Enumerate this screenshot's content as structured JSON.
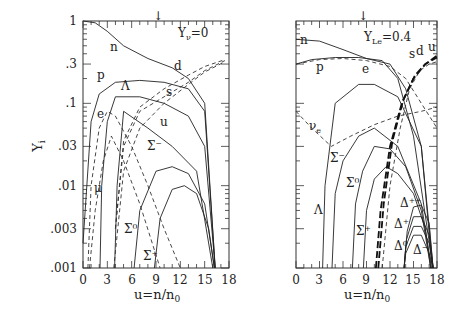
{
  "chart_data": [
    {
      "type": "line",
      "panel": "left",
      "title": "",
      "annotation": "Yν=0",
      "xlabel": "u=n/n0",
      "ylabel": "Yi",
      "xlim": [
        0,
        18
      ],
      "ylim": [
        0.001,
        1
      ],
      "yscale": "log",
      "xticks": [
        "0",
        "3",
        "6",
        "9",
        "12",
        "15",
        "18"
      ],
      "yticks": [
        "1",
        ".3",
        ".1",
        ".03",
        ".01",
        ".003",
        ".001"
      ],
      "series": [
        {
          "name": "n",
          "style": "solid",
          "x": [
            0,
            1.5,
            3,
            5,
            8,
            11,
            13,
            15,
            16.3
          ],
          "y": [
            1,
            0.95,
            0.75,
            0.5,
            0.35,
            0.27,
            0.2,
            0.1,
            0.001
          ]
        },
        {
          "name": "p",
          "style": "solid",
          "x": [
            0,
            1,
            2,
            4,
            7,
            10,
            13,
            15,
            16.3
          ],
          "y": [
            0.002,
            0.06,
            0.13,
            0.18,
            0.19,
            0.18,
            0.15,
            0.08,
            0.001
          ]
        },
        {
          "name": "e",
          "style": "dashed",
          "x": [
            0.6,
            1,
            2,
            3,
            4,
            6,
            8,
            10,
            12
          ],
          "y": [
            0.001,
            0.01,
            0.05,
            0.08,
            0.07,
            0.03,
            0.01,
            0.003,
            0.001
          ]
        },
        {
          "name": "μ",
          "style": "dashed",
          "x": [
            0.8,
            1.5,
            2.5,
            3.5,
            5,
            7,
            9.5
          ],
          "y": [
            0.001,
            0.005,
            0.02,
            0.04,
            0.02,
            0.006,
            0.001
          ]
        },
        {
          "name": "Λ",
          "style": "solid",
          "x": [
            2.1,
            2.3,
            3,
            4,
            7,
            10,
            13,
            15,
            16.3
          ],
          "y": [
            0.001,
            0.01,
            0.06,
            0.12,
            0.12,
            0.1,
            0.07,
            0.03,
            0.001
          ]
        },
        {
          "name": "Σ⁻",
          "style": "solid",
          "x": [
            3.9,
            4.2,
            5,
            8,
            11,
            14,
            16
          ],
          "y": [
            0.001,
            0.01,
            0.08,
            0.05,
            0.03,
            0.015,
            0.001
          ]
        },
        {
          "name": "Σ⁰",
          "style": "solid",
          "x": [
            6.3,
            7,
            9,
            11,
            13,
            15,
            16.2
          ],
          "y": [
            0.001,
            0.005,
            0.015,
            0.017,
            0.014,
            0.006,
            0.001
          ]
        },
        {
          "name": "Σ⁺",
          "style": "solid",
          "x": [
            8.8,
            9.5,
            11,
            12.5,
            14,
            15.5,
            16.2
          ],
          "y": [
            0.001,
            0.004,
            0.009,
            0.01,
            0.008,
            0.003,
            0.001
          ]
        },
        {
          "name": "u",
          "style": "dashed",
          "x": [
            4,
            5,
            7,
            10,
            13,
            15,
            17.5
          ],
          "y": [
            0.003,
            0.03,
            0.08,
            0.12,
            0.18,
            0.25,
            0.33
          ]
        },
        {
          "name": "d",
          "style": "dashed",
          "x": [
            4,
            5,
            7,
            10,
            13,
            15,
            17.5
          ],
          "y": [
            0.003,
            0.035,
            0.09,
            0.15,
            0.22,
            0.28,
            0.34
          ]
        },
        {
          "name": "s",
          "style": "dashed",
          "x": [
            3.8,
            5,
            7,
            10,
            13,
            15,
            17.5
          ],
          "y": [
            0.001,
            0.015,
            0.05,
            0.1,
            0.17,
            0.24,
            0.32
          ]
        }
      ]
    },
    {
      "type": "line",
      "panel": "right",
      "title": "",
      "annotation": "YLe=0.4",
      "xlabel": "u=n/n0",
      "ylabel": "",
      "xlim": [
        0,
        18
      ],
      "ylim": [
        0.001,
        1
      ],
      "yscale": "log",
      "xticks": [
        "0",
        "3",
        "6",
        "9",
        "12",
        "15",
        "18"
      ],
      "yticks": [],
      "series": [
        {
          "name": "n",
          "style": "solid",
          "x": [
            0,
            3,
            6,
            9,
            12,
            14,
            16,
            17.5
          ],
          "y": [
            0.6,
            0.57,
            0.45,
            0.35,
            0.3,
            0.15,
            0.03,
            0.001
          ]
        },
        {
          "name": "p",
          "style": "solid",
          "x": [
            0,
            2,
            5,
            8,
            11,
            13,
            15,
            17.5
          ],
          "y": [
            0.3,
            0.34,
            0.36,
            0.36,
            0.33,
            0.2,
            0.04,
            0.001
          ]
        },
        {
          "name": "e",
          "style": "dashed",
          "x": [
            0,
            3,
            6,
            9,
            12,
            14,
            16,
            18
          ],
          "y": [
            0.3,
            0.34,
            0.35,
            0.33,
            0.28,
            0.2,
            0.1,
            0.05
          ]
        },
        {
          "name": "νe",
          "style": "dashed",
          "x": [
            0,
            2,
            4.5,
            7,
            10,
            13,
            16,
            18
          ],
          "y": [
            0.08,
            0.05,
            0.03,
            0.04,
            0.055,
            0.07,
            0.08,
            0.09
          ]
        },
        {
          "name": "Λ",
          "style": "solid",
          "x": [
            3.4,
            3.7,
            5,
            8,
            10,
            13,
            16,
            17.4
          ],
          "y": [
            0.001,
            0.01,
            0.1,
            0.17,
            0.17,
            0.12,
            0.03,
            0.001
          ]
        },
        {
          "name": "Σ⁻",
          "style": "solid",
          "x": [
            4.6,
            5,
            6,
            8,
            10,
            13,
            16,
            17.3
          ],
          "y": [
            0.001,
            0.008,
            0.02,
            0.04,
            0.05,
            0.03,
            0.006,
            0.001
          ]
        },
        {
          "name": "Σ⁰",
          "style": "solid",
          "x": [
            7.2,
            7.6,
            8.5,
            10,
            12,
            14,
            16,
            17.2
          ],
          "y": [
            0.001,
            0.006,
            0.015,
            0.03,
            0.028,
            0.017,
            0.005,
            0.001
          ]
        },
        {
          "name": "Σ⁺",
          "style": "solid",
          "x": [
            8.6,
            9,
            10,
            11.5,
            13,
            15,
            16.5,
            17.2
          ],
          "y": [
            0.001,
            0.005,
            0.012,
            0.017,
            0.014,
            0.008,
            0.003,
            0.001
          ]
        },
        {
          "name": "u",
          "style": "thickdash",
          "x": [
            10.2,
            10.8,
            12,
            13.5,
            15,
            16.5,
            18
          ],
          "y": [
            0.001,
            0.005,
            0.03,
            0.1,
            0.2,
            0.3,
            0.38
          ]
        },
        {
          "name": "d",
          "style": "thickdash",
          "x": [
            10.5,
            11.2,
            12.3,
            13.7,
            15.2,
            16.5,
            18
          ],
          "y": [
            0.001,
            0.006,
            0.035,
            0.11,
            0.22,
            0.3,
            0.36
          ]
        },
        {
          "name": "s",
          "style": "dashed",
          "x": [
            11,
            12,
            13.3,
            14.5,
            15.8,
            17,
            18
          ],
          "y": [
            0.001,
            0.01,
            0.05,
            0.15,
            0.25,
            0.3,
            0.32
          ]
        },
        {
          "name": "Δ⁻",
          "style": "solid",
          "x": [
            13.8,
            14,
            15,
            16,
            17,
            17.5
          ],
          "y": [
            0.001,
            0.0015,
            0.0025,
            0.0025,
            0.0015,
            0.001
          ]
        },
        {
          "name": "Δ⁰",
          "style": "solid",
          "x": [
            13.8,
            14,
            15,
            16,
            17,
            17.5
          ],
          "y": [
            0.001,
            0.0018,
            0.0032,
            0.0032,
            0.002,
            0.001
          ]
        },
        {
          "name": "Δ⁺",
          "style": "solid",
          "x": [
            13.8,
            14.1,
            15,
            16,
            17,
            17.5
          ],
          "y": [
            0.001,
            0.0022,
            0.0042,
            0.0042,
            0.0025,
            0.001
          ]
        },
        {
          "name": "Δ⁺⁺",
          "style": "solid",
          "x": [
            13.8,
            14.2,
            15,
            16,
            17,
            17.5
          ],
          "y": [
            0.001,
            0.0028,
            0.0055,
            0.0058,
            0.0035,
            0.001
          ]
        }
      ]
    }
  ],
  "left": {
    "annotation": "Y",
    "annotation_sub": "ν",
    "annotation_rest": "=0",
    "ylabel": "Y",
    "ylabel_sub": "i",
    "xlabel": "u=n/n",
    "xlabel_sub": "0",
    "xticks": [
      "0",
      "3",
      "6",
      "9",
      "12",
      "15",
      "18"
    ],
    "yticks": [
      "1",
      ".3",
      ".1",
      ".03",
      ".01",
      ".003",
      ".001"
    ],
    "labels": {
      "n": "n",
      "p": "p",
      "d": "d",
      "lambda": "Λ",
      "s": "s",
      "e": "e",
      "u": "u",
      "sigma_minus": "Σ⁻",
      "mu": "μ",
      "sigma_zero": "Σ⁰",
      "sigma_plus": "Σ⁺"
    }
  },
  "right": {
    "annotation": "Y",
    "annotation_sub": "Le",
    "annotation_rest": "=0.4",
    "xlabel": "u=n/n",
    "xlabel_sub": "0",
    "xticks": [
      "0",
      "3",
      "6",
      "9",
      "12",
      "15",
      "18"
    ],
    "labels": {
      "n": "n",
      "p": "p",
      "e": "e",
      "s": "s",
      "d": "d",
      "u": "u",
      "nu": "ν",
      "nu_sub": "e",
      "sigma_minus": "Σ⁻",
      "sigma_zero": "Σ⁰",
      "lambda": "Λ",
      "sigma_plus": "Σ⁺",
      "delta_pp": "Δ⁺⁺",
      "delta_p": "Δ⁺",
      "delta_0": "Δ⁰",
      "delta_m": "Δ⁻"
    }
  },
  "top_marker": "↓"
}
